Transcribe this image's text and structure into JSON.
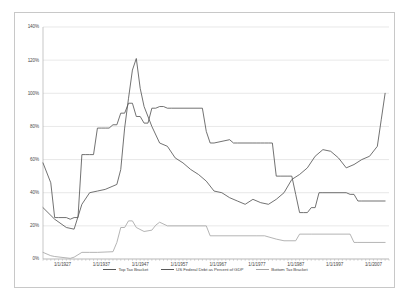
{
  "chart_data": {
    "type": "line",
    "title": "",
    "xlabel": "",
    "ylabel": "",
    "ylim": [
      0,
      140
    ],
    "yticks": [
      "0%",
      "20%",
      "40%",
      "60%",
      "80%",
      "100%",
      "120%",
      "140%"
    ],
    "ytick_values": [
      0,
      20,
      40,
      60,
      80,
      100,
      120,
      140
    ],
    "xticks": [
      "1/1/1927",
      "1/1/1937",
      "1/1/1947",
      "1/1/1957",
      "1/1/1967",
      "1/1/1977",
      "1/1/1987",
      "1/1/1997",
      "1/1/2007"
    ],
    "xtick_values": [
      1927,
      1937,
      1947,
      1957,
      1967,
      1977,
      1987,
      1997,
      2007
    ],
    "xlim": [
      1922,
      2011
    ],
    "grid": "horizontal",
    "legend_position": "bottom",
    "series": [
      {
        "name": "Top Tax Bracket",
        "color": "#595959",
        "x": [
          1922,
          1924,
          1925,
          1926,
          1928,
          1929,
          1930,
          1931,
          1932,
          1933,
          1934,
          1935,
          1936,
          1937,
          1938,
          1939,
          1940,
          1941,
          1942,
          1943,
          1944,
          1945,
          1946,
          1947,
          1948,
          1949,
          1950,
          1951,
          1952,
          1953,
          1954,
          1955,
          1963,
          1964,
          1965,
          1966,
          1970,
          1971,
          1972,
          1976,
          1977,
          1978,
          1979,
          1980,
          1981,
          1982,
          1983,
          1984,
          1985,
          1986,
          1987,
          1988,
          1989,
          1990,
          1991,
          1992,
          1993,
          1994,
          2000,
          2001,
          2002,
          2003,
          2004,
          2010
        ],
        "values": [
          58,
          46,
          25,
          25,
          25,
          24,
          25,
          25,
          63,
          63,
          63,
          63,
          79,
          79,
          79,
          79,
          81,
          81,
          88,
          88,
          94,
          94,
          86,
          86,
          82,
          82,
          91,
          91,
          92,
          92,
          91,
          91,
          91,
          77,
          70,
          70,
          72,
          70,
          70,
          70,
          70,
          70,
          70,
          70,
          70,
          50,
          50,
          50,
          50,
          50,
          39,
          28,
          28,
          28,
          31,
          31,
          40,
          40,
          40,
          39,
          39,
          35,
          35,
          35
        ]
      },
      {
        "name": "US Federal Debt as Percent of GDP",
        "color": "#595959",
        "x": [
          1922,
          1925,
          1928,
          1930,
          1932,
          1934,
          1936,
          1938,
          1940,
          1941,
          1942,
          1943,
          1944,
          1945,
          1946,
          1947,
          1948,
          1950,
          1952,
          1954,
          1956,
          1958,
          1960,
          1962,
          1964,
          1966,
          1968,
          1970,
          1972,
          1974,
          1976,
          1978,
          1980,
          1982,
          1984,
          1986,
          1988,
          1990,
          1992,
          1994,
          1996,
          1998,
          2000,
          2002,
          2004,
          2006,
          2008,
          2009,
          2010
        ],
        "values": [
          31,
          24,
          19,
          18,
          33,
          40,
          41,
          42,
          44,
          45,
          54,
          79,
          97,
          114,
          121,
          103,
          92,
          80,
          70,
          68,
          61,
          58,
          54,
          51,
          47,
          41,
          40,
          37,
          35,
          33,
          36,
          34,
          33,
          36,
          40,
          48,
          51,
          55,
          62,
          66,
          65,
          61,
          55,
          57,
          60,
          62,
          68,
          84,
          100
        ]
      },
      {
        "name": "Bottom Tax Bracket",
        "color": "#a6a6a6",
        "x": [
          1922,
          1924,
          1925,
          1929,
          1930,
          1932,
          1934,
          1936,
          1940,
          1941,
          1942,
          1943,
          1944,
          1945,
          1946,
          1948,
          1950,
          1951,
          1952,
          1954,
          1964,
          1965,
          1977,
          1979,
          1982,
          1984,
          1987,
          1988,
          1991,
          2001,
          2002,
          2003,
          2010
        ],
        "values": [
          4,
          2,
          1.5,
          0.4,
          1.1,
          4,
          4,
          4,
          4.4,
          10,
          19,
          19,
          23,
          23,
          19,
          16.6,
          17.4,
          20.4,
          22.2,
          20,
          20,
          14,
          14,
          14,
          12,
          11,
          11,
          15,
          15,
          15,
          10,
          10,
          10
        ]
      }
    ]
  }
}
